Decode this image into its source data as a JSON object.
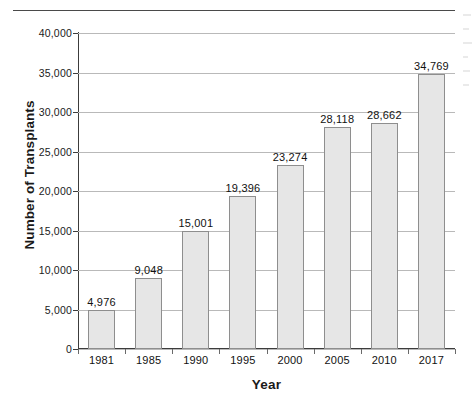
{
  "chart_data": {
    "type": "bar",
    "title": "",
    "xlabel": "Year",
    "ylabel": "Number of Transplants",
    "categories": [
      "1981",
      "1985",
      "1990",
      "1995",
      "2000",
      "2005",
      "2010",
      "2017"
    ],
    "values": [
      4976,
      9048,
      15001,
      19396,
      23274,
      28118,
      28662,
      34769
    ],
    "value_labels": [
      "4,976",
      "9,048",
      "15,001",
      "19,396",
      "23,274",
      "28,118",
      "28,662",
      "34,769"
    ],
    "ylim": [
      0,
      40000
    ],
    "ytick_values": [
      0,
      5000,
      10000,
      15000,
      20000,
      25000,
      30000,
      35000,
      40000
    ],
    "ytick_labels": [
      "0",
      "5,000",
      "10,000",
      "15,000",
      "20,000",
      "25,000",
      "30,000",
      "35,000",
      "40,000"
    ],
    "grid": true,
    "legend": null,
    "legend_position": "none",
    "series_name": "Number of Transplants",
    "colors": {
      "bar_fill": "#e6e6e6",
      "bar_border": "#8e8e8e",
      "gridline": "#b9b9b9",
      "axis": "#3c3c3c",
      "text": "#111111"
    }
  }
}
